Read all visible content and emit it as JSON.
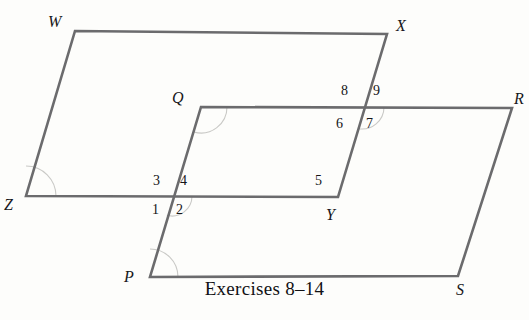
{
  "figure": {
    "caption": "Exercises 8–14",
    "background_color": "#fdfdfb",
    "stroke_color": "#6b6b6d",
    "stroke_width": 2.6,
    "arc_color": "#c9c9c6",
    "label_color": "#17171a",
    "canvas": {
      "width": 529,
      "height": 320
    }
  },
  "shapes": [
    {
      "name": "parallelogram-wxyz",
      "vertices": [
        {
          "label": "W",
          "x": 75,
          "y": 31
        },
        {
          "label": "X",
          "x": 387,
          "y": 34
        },
        {
          "label": "Y",
          "x": 338,
          "y": 197
        },
        {
          "label": "Z",
          "x": 26,
          "y": 196
        }
      ]
    },
    {
      "name": "parallelogram-pqrs",
      "vertices": [
        {
          "label": "Q",
          "x": 201,
          "y": 107
        },
        {
          "label": "R",
          "x": 512,
          "y": 108
        },
        {
          "label": "S",
          "x": 458,
          "y": 276
        },
        {
          "label": "P",
          "x": 150,
          "y": 277
        }
      ]
    }
  ],
  "vertex_labels": [
    {
      "id": "label-w",
      "text": "W",
      "x": 48,
      "y": 14
    },
    {
      "id": "label-x",
      "text": "X",
      "x": 396,
      "y": 18
    },
    {
      "id": "label-q",
      "text": "Q",
      "x": 172,
      "y": 90
    },
    {
      "id": "label-r",
      "text": "R",
      "x": 514,
      "y": 91
    },
    {
      "id": "label-z",
      "text": "Z",
      "x": 4,
      "y": 197
    },
    {
      "id": "label-y",
      "text": "Y",
      "x": 326,
      "y": 207
    },
    {
      "id": "label-p",
      "text": "P",
      "x": 124,
      "y": 269
    },
    {
      "id": "label-s",
      "text": "S",
      "x": 456,
      "y": 282
    }
  ],
  "angle_numbers": [
    {
      "id": "angle-8",
      "text": "8",
      "x": 341,
      "y": 84
    },
    {
      "id": "angle-9",
      "text": "9",
      "x": 373,
      "y": 84
    },
    {
      "id": "angle-6",
      "text": "6",
      "x": 336,
      "y": 117
    },
    {
      "id": "angle-7",
      "text": "7",
      "x": 366,
      "y": 117
    },
    {
      "id": "angle-3",
      "text": "3",
      "x": 153,
      "y": 174
    },
    {
      "id": "angle-4",
      "text": "4",
      "x": 180,
      "y": 174
    },
    {
      "id": "angle-5",
      "text": "5",
      "x": 315,
      "y": 174
    },
    {
      "id": "angle-1",
      "text": "1",
      "x": 152,
      "y": 203
    },
    {
      "id": "angle-2",
      "text": "2",
      "x": 176,
      "y": 203
    }
  ],
  "angle_arcs": [
    {
      "id": "arc-z",
      "cx": 26,
      "cy": 196,
      "r": 30,
      "start_deg": 270,
      "end_deg": 360
    },
    {
      "id": "arc-p",
      "cx": 150,
      "cy": 277,
      "r": 28,
      "start_deg": 270,
      "end_deg": 360
    },
    {
      "id": "arc-q",
      "cx": 201,
      "cy": 107,
      "r": 26,
      "start_deg": 0,
      "end_deg": 105
    },
    {
      "id": "arc-intersection-left",
      "cx": 172,
      "cy": 196,
      "r": 20,
      "start_deg": 0,
      "end_deg": 105
    },
    {
      "id": "arc-intersection-right",
      "cx": 362,
      "cy": 107,
      "r": 22,
      "start_deg": 0,
      "end_deg": 100
    }
  ],
  "caption": {
    "text": "Exercises 8–14",
    "x": 235,
    "y": 292
  }
}
